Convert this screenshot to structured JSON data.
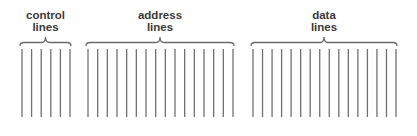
{
  "diagram": {
    "title": "",
    "line_color": "#707070",
    "brace_color": "#6a6a6a",
    "label_color": "#3a3a3a",
    "line_top": 49,
    "line_bottom": 117,
    "brace_top": 37,
    "brace_bottom": 46,
    "groups": [
      {
        "id": "control",
        "label_line1": "control",
        "label_line2": "lines",
        "line_count": 6,
        "x_start": 22,
        "x_end": 70,
        "label_top": 10
      },
      {
        "id": "address",
        "label_line1": "address",
        "label_line2": "lines",
        "line_count": 16,
        "x_start": 88,
        "x_end": 233,
        "label_top": 10
      },
      {
        "id": "data",
        "label_line1": "data",
        "label_line2": "lines",
        "line_count": 16,
        "x_start": 253,
        "x_end": 396,
        "label_top": 10
      }
    ]
  }
}
